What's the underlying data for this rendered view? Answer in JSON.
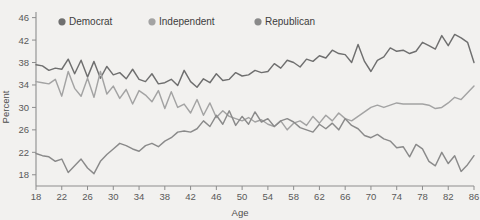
{
  "chart_data": {
    "type": "line",
    "title": "",
    "xlabel": "Age",
    "ylabel": "Percent",
    "xlim": [
      18,
      86
    ],
    "ylim": [
      16,
      47
    ],
    "grid": false,
    "legend_position": "top-inside",
    "xticks": [
      18,
      22,
      26,
      30,
      34,
      38,
      42,
      46,
      50,
      54,
      58,
      62,
      66,
      70,
      74,
      78,
      82,
      86
    ],
    "yticks": [
      18,
      22,
      26,
      30,
      34,
      38,
      42,
      46
    ],
    "x": [
      18,
      19,
      20,
      21,
      22,
      23,
      24,
      25,
      26,
      27,
      28,
      29,
      30,
      31,
      32,
      33,
      34,
      35,
      36,
      37,
      38,
      39,
      40,
      41,
      42,
      43,
      44,
      45,
      46,
      47,
      48,
      49,
      50,
      51,
      52,
      53,
      54,
      55,
      56,
      57,
      58,
      59,
      60,
      61,
      62,
      63,
      64,
      65,
      66,
      67,
      68,
      69,
      70,
      71,
      72,
      73,
      74,
      75,
      76,
      77,
      78,
      79,
      80,
      81,
      82,
      83,
      84,
      85,
      86
    ],
    "series": [
      {
        "name": "Democrat",
        "color": "#6f6f6f",
        "values": [
          37.6,
          37.4,
          36.6,
          37.0,
          36.8,
          38.6,
          36.0,
          38.4,
          35.4,
          38.2,
          35.2,
          37.3,
          35.8,
          36.2,
          35.1,
          36.8,
          35.0,
          34.6,
          36.0,
          34.2,
          34.4,
          35.0,
          33.9,
          36.6,
          34.6,
          33.6,
          35.1,
          34.4,
          36.0,
          34.8,
          35.0,
          36.2,
          35.6,
          35.8,
          36.6,
          36.2,
          36.4,
          37.8,
          37.0,
          38.4,
          38.0,
          37.2,
          38.6,
          38.2,
          39.2,
          38.8,
          40.2,
          39.6,
          39.4,
          38.0,
          41.2,
          38.2,
          36.4,
          38.4,
          39.0,
          40.6,
          40.0,
          40.2,
          39.6,
          40.0,
          41.6,
          41.0,
          40.4,
          42.8,
          41.0,
          43.0,
          42.4,
          41.6,
          38.0
        ]
      },
      {
        "name": "Independent",
        "color": "#a3a3a3",
        "values": [
          34.6,
          34.4,
          34.2,
          35.0,
          32.0,
          36.4,
          33.4,
          32.0,
          35.2,
          31.8,
          36.4,
          32.4,
          33.8,
          31.6,
          33.2,
          30.6,
          33.0,
          32.2,
          31.0,
          33.0,
          29.8,
          32.8,
          30.0,
          30.6,
          29.0,
          31.4,
          28.6,
          30.8,
          28.2,
          29.4,
          28.4,
          28.0,
          27.6,
          28.2,
          27.4,
          27.8,
          27.0,
          26.6,
          27.6,
          26.0,
          27.2,
          27.6,
          26.8,
          28.4,
          27.2,
          28.6,
          27.6,
          29.0,
          28.0,
          27.6,
          28.4,
          29.2,
          30.0,
          30.4,
          30.0,
          30.4,
          30.8,
          30.6,
          30.6,
          30.6,
          30.6,
          30.4,
          29.8,
          30.0,
          30.8,
          31.8,
          31.4,
          32.6,
          33.8
        ]
      },
      {
        "name": "Republican",
        "color": "#8a8a8a",
        "values": [
          21.8,
          21.4,
          21.2,
          20.4,
          20.8,
          18.4,
          19.6,
          20.8,
          19.2,
          18.2,
          20.4,
          21.6,
          22.6,
          23.6,
          23.2,
          22.6,
          22.2,
          23.2,
          23.6,
          23.0,
          24.0,
          24.6,
          25.6,
          25.8,
          25.6,
          26.2,
          27.6,
          26.6,
          28.6,
          27.0,
          29.4,
          26.8,
          28.4,
          27.0,
          29.2,
          27.4,
          28.0,
          26.6,
          27.6,
          28.0,
          27.4,
          26.4,
          26.0,
          25.6,
          27.0,
          26.2,
          27.2,
          26.0,
          28.0,
          26.8,
          26.2,
          25.0,
          24.6,
          25.2,
          24.4,
          24.0,
          22.8,
          23.0,
          21.2,
          23.4,
          22.6,
          20.4,
          19.6,
          22.0,
          20.0,
          21.4,
          18.6,
          19.8,
          21.4
        ]
      }
    ]
  },
  "legend": {
    "items": [
      {
        "label": "Democrat",
        "marker": "dot-marker"
      },
      {
        "label": "Independent",
        "marker": "dot-marker"
      },
      {
        "label": "Republican",
        "marker": "dot-marker"
      }
    ]
  },
  "axes": {
    "x_title": "Age",
    "y_title": "Percent"
  },
  "colors": {
    "background": "#f2f1ef",
    "axis": "#8d8d8d",
    "democrat": "#6f6f6f",
    "independent": "#a3a3a3",
    "republican": "#8a8a8a"
  }
}
